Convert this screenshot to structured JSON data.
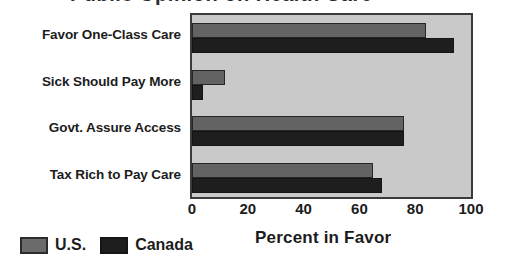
{
  "title_fragment": "Public Opinion on Health Care",
  "legend": {
    "position": "bottom-left",
    "entries": [
      {
        "label": "U.S.",
        "color": "#636363",
        "swatch_name": "legend-swatch-us"
      },
      {
        "label": "Canada",
        "color": "#1e1e1e",
        "swatch_name": "legend-swatch-canada"
      }
    ]
  },
  "axis": {
    "x_title": "Percent in Favor",
    "x_ticks": [
      "0",
      "20",
      "40",
      "60",
      "80",
      "100"
    ]
  },
  "chart_data": {
    "type": "bar",
    "orientation": "horizontal",
    "title": "",
    "xlabel": "Percent in Favor",
    "ylabel": "",
    "xlim": [
      0,
      100
    ],
    "xticks": [
      0,
      20,
      40,
      60,
      80,
      100
    ],
    "grid": false,
    "legend_position": "bottom-left",
    "categories": [
      "Favor One-Class Care",
      "Sick Should Pay More",
      "Govt. Assure Access",
      "Tax Rich to Pay Care"
    ],
    "series": [
      {
        "name": "U.S.",
        "color": "#636363",
        "values": [
          84,
          12,
          76,
          65
        ]
      },
      {
        "name": "Canada",
        "color": "#1e1e1e",
        "values": [
          94,
          4,
          76,
          68
        ]
      }
    ]
  }
}
